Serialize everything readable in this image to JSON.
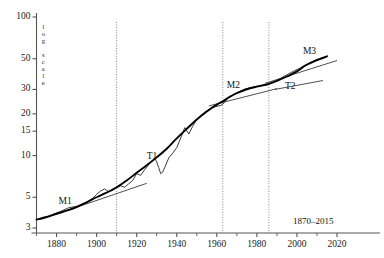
{
  "chart_data": {
    "type": "line",
    "title": "",
    "subtitle": "",
    "xlabel": "",
    "ylabel": "log scale",
    "yscale": "log",
    "xlim": [
      1870,
      2024
    ],
    "ylim": [
      3,
      115
    ],
    "grid": false,
    "legend_position": "none",
    "range_note": "1870–2015",
    "ytick_labels": [
      "100",
      "50",
      "30",
      "20",
      "15",
      "10",
      "5",
      "3"
    ],
    "ytick_values": [
      100,
      50,
      30,
      20,
      15,
      10,
      5,
      3
    ],
    "xtick_labels": [
      "1880",
      "1900",
      "1920",
      "1940",
      "1960",
      "1980",
      "2000",
      "2020"
    ],
    "xtick_values": [
      1880,
      1900,
      1920,
      1940,
      1960,
      1980,
      2000,
      2020
    ],
    "series": [
      {
        "name": "fitted trend curve",
        "style": "smooth-thick",
        "x": [
          1870,
          1875,
          1880,
          1885,
          1890,
          1895,
          1900,
          1905,
          1910,
          1915,
          1920,
          1925,
          1930,
          1935,
          1940,
          1945,
          1950,
          1955,
          1960,
          1963,
          1966,
          1970,
          1975,
          1980,
          1985,
          1986,
          1990,
          1995,
          2000,
          2004,
          2008,
          2012,
          2015
        ],
        "values": [
          3.45,
          3.6,
          3.8,
          4.0,
          4.25,
          4.6,
          5.0,
          5.4,
          5.9,
          6.6,
          7.5,
          8.5,
          9.7,
          11.2,
          13.3,
          15.6,
          18.2,
          20.8,
          23.3,
          24.6,
          26.3,
          28.2,
          30.1,
          31.4,
          32.6,
          32.9,
          34.6,
          37.2,
          40.5,
          44.5,
          47.5,
          50.0,
          52.0
        ]
      },
      {
        "name": "observed data",
        "style": "thin-noisy",
        "x": [
          1870,
          1874,
          1878,
          1882,
          1886,
          1890,
          1894,
          1898,
          1900,
          1902,
          1904,
          1905,
          1906,
          1908,
          1910,
          1912,
          1914,
          1916,
          1918,
          1920,
          1922,
          1924,
          1926,
          1928,
          1929,
          1930,
          1931,
          1932,
          1933,
          1934,
          1936,
          1938,
          1940,
          1942,
          1944,
          1945,
          1946,
          1948,
          1950,
          1954,
          1958,
          1962,
          1963,
          1966,
          1970,
          1974,
          1978,
          1982,
          1986,
          1990,
          1994,
          1998,
          2002,
          2006,
          2010,
          2013,
          2015
        ],
        "values": [
          3.45,
          3.55,
          3.75,
          3.95,
          4.2,
          4.3,
          4.5,
          4.9,
          5.25,
          5.55,
          5.75,
          5.6,
          5.5,
          5.6,
          5.85,
          6.05,
          5.9,
          6.25,
          6.6,
          7.4,
          7.2,
          7.9,
          8.6,
          9.3,
          9.6,
          9.0,
          8.2,
          7.4,
          7.6,
          8.2,
          9.6,
          10.4,
          11.4,
          13.4,
          15.9,
          15.1,
          14.3,
          16.3,
          18.2,
          20.6,
          22.3,
          23.0,
          23.5,
          26.4,
          28.3,
          30.2,
          31.2,
          32.1,
          32.8,
          34.8,
          37.6,
          40.4,
          43.1,
          46.4,
          49.5,
          51.0,
          52.2
        ]
      }
    ],
    "regime_lines": [
      {
        "name": "M1",
        "x0": 1872,
        "y0": 3.45,
        "x1": 1925,
        "y1": 6.3
      },
      {
        "name": "T1",
        "x0": 1956,
        "y0": 22.8,
        "x1": 1990,
        "y1": 30.4
      },
      {
        "name": "M2",
        "x0": 1984,
        "y0": 33.2,
        "x1": 2020,
        "y1": 48.5
      },
      {
        "name": "T2",
        "x0": 1989,
        "y0": 30.0,
        "x1": 2013,
        "y1": 34.8
      }
    ],
    "annotations": [
      {
        "label": "M1",
        "x": 1881,
        "y": 4.55
      },
      {
        "label": "T1",
        "x": 1925,
        "y": 9.6
      },
      {
        "label": "M2",
        "x": 1965,
        "y": 31.0
      },
      {
        "label": "T2",
        "x": 1994,
        "y": 30.7
      },
      {
        "label": "M3",
        "x": 2003,
        "y": 55.0
      }
    ],
    "vertical_markers": [
      {
        "x": 1910,
        "style": "dotted"
      },
      {
        "x": 1963,
        "style": "dotted"
      },
      {
        "x": 1986,
        "style": "dotted"
      }
    ],
    "colors": {
      "axis": "#555555",
      "curve": "#000000",
      "data": "#1a1a1a",
      "marker_line": "#777777",
      "regime_line": "#222222",
      "text": "#111111",
      "background": "#ffffff"
    }
  }
}
